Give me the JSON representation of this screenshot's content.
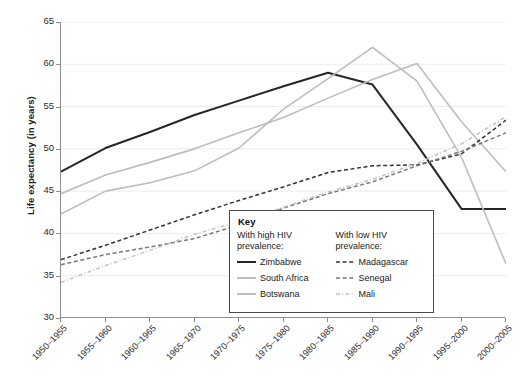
{
  "chart_data": {
    "type": "line",
    "title": "",
    "xlabel": "",
    "ylabel": "Life expectancy (in years)",
    "ylim": [
      30,
      65
    ],
    "yticks": [
      30,
      35,
      40,
      45,
      50,
      55,
      60,
      65
    ],
    "grid": true,
    "grid_axis": "y",
    "legend_position": "inside-bottom-center",
    "categories": [
      "1950–1955",
      "1955–1960",
      "1960–1965",
      "1965–1970",
      "1970–1975",
      "1975–1980",
      "1980–1985",
      "1985–1990",
      "1990–1995",
      "1995–2000",
      "2000–2005"
    ],
    "series": [
      {
        "name": "Zimbabwe",
        "group": "With high HIV prevalence:",
        "color": "#262626",
        "style": "solid",
        "width": 2.0,
        "values": [
          47.3,
          50.1,
          52.0,
          54.0,
          55.7,
          57.4,
          59.0,
          57.6,
          50.5,
          42.9,
          42.9
        ]
      },
      {
        "name": "South Africa",
        "group": "With high HIV prevalence:",
        "color": "#bdbdbd",
        "style": "solid",
        "width": 1.6,
        "values": [
          44.7,
          46.9,
          48.4,
          50.0,
          51.9,
          53.7,
          56.0,
          58.2,
          60.1,
          53.2,
          47.3
        ]
      },
      {
        "name": "Botswana",
        "group": "With high HIV prevalence:",
        "color": "#bdbdbd",
        "style": "solid",
        "width": 1.6,
        "values": [
          42.3,
          45.0,
          46.0,
          47.4,
          50.1,
          54.7,
          58.3,
          62.0,
          58.0,
          49.0,
          36.4
        ]
      },
      {
        "name": "Madagascar",
        "group": "With low HIV prevalence:",
        "color": "#333333",
        "style": "dashed",
        "width": 1.5,
        "values": [
          36.9,
          38.6,
          40.4,
          42.2,
          43.9,
          45.5,
          47.2,
          48.0,
          48.1,
          49.4,
          53.4
        ]
      },
      {
        "name": "Senegal",
        "group": "With low HIV prevalence:",
        "color": "#777777",
        "style": "dashed",
        "width": 1.5,
        "values": [
          36.3,
          37.5,
          38.4,
          39.4,
          41.0,
          43.0,
          44.7,
          46.1,
          48.0,
          49.7,
          51.9
        ]
      },
      {
        "name": "Mali",
        "group": "With low HIV prevalence:",
        "color": "#c2c2c2",
        "style": "dashdot",
        "width": 1.5,
        "values": [
          34.2,
          36.2,
          38.0,
          39.9,
          41.4,
          43.1,
          44.9,
          46.4,
          48.3,
          50.6,
          53.8
        ]
      }
    ]
  },
  "legend": {
    "title": "Key",
    "columns": [
      {
        "heading": "With high HIV prevalence:",
        "items": [
          {
            "label": "Zimbabwe",
            "color": "#262626",
            "style": "solid"
          },
          {
            "label": "South Africa",
            "color": "#bdbdbd",
            "style": "solid"
          },
          {
            "label": "Botswana",
            "color": "#bdbdbd",
            "style": "solid"
          }
        ]
      },
      {
        "heading": "With low HIV prevalence:",
        "items": [
          {
            "label": "Madagascar",
            "color": "#333333",
            "style": "dashed"
          },
          {
            "label": "Senegal",
            "color": "#777777",
            "style": "dashed"
          },
          {
            "label": "Mali",
            "color": "#c2c2c2",
            "style": "dashdot"
          }
        ]
      }
    ]
  },
  "axes": {
    "y_title": "Life expectancy (in years)",
    "y_tick_labels": [
      "30",
      "35",
      "40",
      "45",
      "50",
      "55",
      "60",
      "65"
    ],
    "x_tick_labels": [
      "1950–1955",
      "1955–1960",
      "1960–1965",
      "1965–1970",
      "1970–1975",
      "1975–1980",
      "1980–1985",
      "1985–1990",
      "1990–1995",
      "1995–2000",
      "2000–2005"
    ]
  },
  "colors": {
    "axis": "#8d8d8d",
    "grid": "#ececec",
    "text": "#1a1a1a",
    "background": "#ffffff",
    "legend_border": "#4a4a4a"
  }
}
